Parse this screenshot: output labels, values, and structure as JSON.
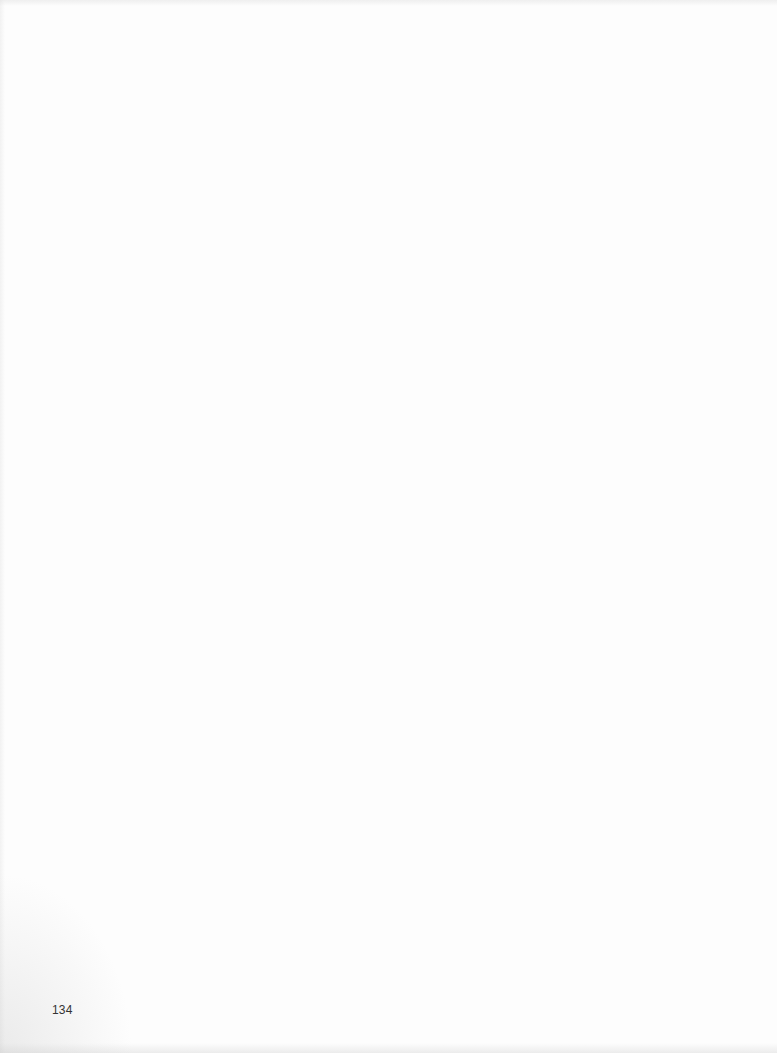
{
  "page": {
    "page_number": "134",
    "background_color": "#fdfdfd"
  }
}
